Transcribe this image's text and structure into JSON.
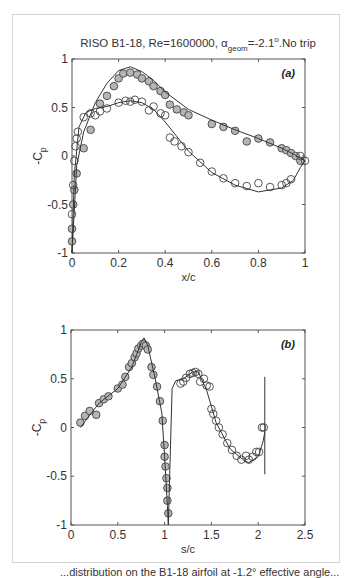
{
  "chart_data": [
    {
      "type": "scatter",
      "panel_label": "(a)",
      "title": "RISO B1-18, Re=1600000, α_geom=-2.1°.No trip",
      "title_parts": {
        "main": "RISO B1-18, Re=1600000, ",
        "alpha": "α",
        "sub": "geom",
        "rest": "=-2.1",
        "sup": "o",
        "tail": ".No trip"
      },
      "xlabel": "x/c",
      "ylabel": "-C_p",
      "xlim": [
        0,
        1
      ],
      "ylim": [
        -1,
        1
      ],
      "xticks": [
        "0",
        "0.2",
        "0.4",
        "0.6",
        "0.8",
        "1"
      ],
      "yticks": [
        "1",
        "0.5",
        "0",
        "-0.5",
        "-1"
      ],
      "grid": false,
      "series": [
        {
          "name": "experiment filled (suction side)",
          "style": "gray-filled-circle",
          "x": [
            0.0,
            0.0,
            0.005,
            0.01,
            0.02,
            0.05,
            0.08,
            0.12,
            0.15,
            0.18,
            0.2,
            0.22,
            0.25,
            0.28,
            0.3,
            0.33,
            0.35,
            0.38,
            0.4,
            0.42,
            0.45,
            0.48,
            0.5,
            0.6,
            0.65,
            0.7,
            0.75,
            0.8,
            0.85,
            0.9,
            0.92,
            0.94,
            0.96,
            0.98
          ],
          "y": [
            -0.88,
            -0.75,
            -0.5,
            -0.35,
            -0.18,
            0.08,
            0.27,
            0.54,
            0.62,
            0.72,
            0.8,
            0.85,
            0.86,
            0.84,
            0.8,
            0.77,
            0.72,
            0.67,
            0.63,
            0.53,
            0.48,
            0.45,
            0.42,
            0.33,
            0.3,
            0.26,
            0.15,
            0.18,
            0.14,
            0.08,
            0.06,
            0.03,
            0.0,
            -0.05
          ]
        },
        {
          "name": "experiment open (pressure side)",
          "style": "open-circle",
          "x": [
            0.0,
            0.005,
            0.01,
            0.015,
            0.02,
            0.025,
            0.05,
            0.08,
            0.1,
            0.12,
            0.15,
            0.2,
            0.23,
            0.25,
            0.27,
            0.3,
            0.33,
            0.35,
            0.38,
            0.4,
            0.42,
            0.44,
            0.47,
            0.5,
            0.55,
            0.6,
            0.65,
            0.7,
            0.75,
            0.8,
            0.85,
            0.9,
            0.92,
            0.94,
            0.98,
            1.0
          ],
          "y": [
            -0.6,
            -0.3,
            -0.05,
            0.1,
            0.18,
            0.25,
            0.4,
            0.44,
            0.42,
            0.46,
            0.49,
            0.55,
            0.57,
            0.56,
            0.58,
            0.56,
            0.47,
            0.51,
            0.44,
            0.42,
            0.19,
            0.15,
            0.1,
            0.04,
            -0.07,
            -0.16,
            -0.23,
            -0.28,
            -0.31,
            -0.28,
            -0.32,
            -0.3,
            -0.28,
            -0.24,
            0.0,
            -0.05
          ]
        },
        {
          "name": "computation suction side",
          "style": "line",
          "x": [
            0.0,
            0.02,
            0.05,
            0.1,
            0.15,
            0.2,
            0.25,
            0.3,
            0.35,
            0.4,
            0.5,
            0.6,
            0.7,
            0.8,
            0.9,
            0.95,
            1.0
          ],
          "y": [
            -1.0,
            -0.1,
            0.25,
            0.55,
            0.75,
            0.88,
            0.92,
            0.87,
            0.78,
            0.66,
            0.48,
            0.37,
            0.27,
            0.18,
            0.08,
            0.02,
            -0.05
          ]
        },
        {
          "name": "computation pressure side",
          "style": "line",
          "x": [
            0.0,
            0.01,
            0.03,
            0.06,
            0.1,
            0.15,
            0.2,
            0.25,
            0.3,
            0.35,
            0.4,
            0.5,
            0.6,
            0.7,
            0.8,
            0.9,
            0.95,
            0.98,
            1.0
          ],
          "y": [
            -1.0,
            -0.2,
            0.3,
            0.45,
            0.49,
            0.51,
            0.55,
            0.57,
            0.55,
            0.48,
            0.35,
            0.05,
            -0.17,
            -0.3,
            -0.37,
            -0.33,
            -0.25,
            -0.12,
            -0.05
          ]
        }
      ]
    },
    {
      "type": "scatter",
      "panel_label": "(b)",
      "xlabel": "s/c",
      "ylabel": "-C_p",
      "xlim": [
        0,
        2.5
      ],
      "ylim": [
        -1,
        1
      ],
      "xticks": [
        "0",
        "0.5",
        "1",
        "1.5",
        "2",
        "2.5"
      ],
      "yticks": [
        "1",
        "0.5",
        "0",
        "-0.5",
        "-1"
      ],
      "grid": false,
      "series": [
        {
          "name": "experiment filled",
          "style": "gray-filled-circle",
          "x": [
            0.1,
            0.15,
            0.2,
            0.27,
            0.3,
            0.35,
            0.4,
            0.5,
            0.55,
            0.58,
            0.62,
            0.65,
            0.68,
            0.7,
            0.72,
            0.75,
            0.77,
            0.8,
            0.82,
            0.86,
            0.88,
            0.92,
            0.95,
            0.98,
            1.0,
            1.0,
            1.01,
            1.02,
            1.03,
            1.03,
            1.04
          ],
          "y": [
            0.05,
            0.12,
            0.17,
            0.13,
            0.25,
            0.29,
            0.32,
            0.4,
            0.44,
            0.52,
            0.62,
            0.66,
            0.72,
            0.76,
            0.81,
            0.84,
            0.86,
            0.84,
            0.8,
            0.62,
            0.54,
            0.42,
            0.27,
            0.07,
            -0.18,
            -0.3,
            -0.4,
            -0.52,
            -0.62,
            -0.75,
            -0.88
          ]
        },
        {
          "name": "experiment open",
          "style": "open-circle",
          "x": [
            1.17,
            1.2,
            1.23,
            1.27,
            1.3,
            1.33,
            1.36,
            1.38,
            1.42,
            1.45,
            1.48,
            1.5,
            1.52,
            1.55,
            1.58,
            1.62,
            1.67,
            1.72,
            1.77,
            1.82,
            1.87,
            1.9,
            1.94,
            1.98,
            2.01,
            2.04,
            2.06
          ],
          "y": [
            0.45,
            0.47,
            0.51,
            0.55,
            0.56,
            0.57,
            0.55,
            0.47,
            0.5,
            0.43,
            0.42,
            0.19,
            0.14,
            0.07,
            0.0,
            -0.07,
            -0.16,
            -0.23,
            -0.29,
            -0.33,
            -0.29,
            -0.33,
            -0.3,
            -0.25,
            -0.25,
            0.0,
            0.0
          ]
        },
        {
          "name": "computation",
          "style": "line",
          "x": [
            0.1,
            0.3,
            0.5,
            0.65,
            0.75,
            0.78,
            0.82,
            0.9,
            0.97,
            1.0,
            1.03,
            1.04,
            1.06,
            1.08,
            1.12,
            1.2,
            1.3,
            1.36,
            1.45,
            1.55,
            1.7,
            1.85,
            1.9,
            2.0,
            2.05,
            2.07
          ],
          "y": [
            0.0,
            0.25,
            0.4,
            0.62,
            0.87,
            0.92,
            0.84,
            0.5,
            0.15,
            -0.3,
            -0.8,
            -1.0,
            -0.3,
            0.4,
            0.48,
            0.5,
            0.57,
            0.57,
            0.38,
            0.05,
            -0.22,
            -0.34,
            -0.36,
            -0.3,
            -0.15,
            -0.05
          ]
        },
        {
          "name": "trailing edge marker",
          "style": "line",
          "x": [
            2.07,
            2.07
          ],
          "y": [
            0.52,
            -0.48
          ]
        }
      ]
    }
  ],
  "figure": {
    "caption_partial": "...distribution on the B1-18 airfoil at -1.2° effective angle..."
  }
}
